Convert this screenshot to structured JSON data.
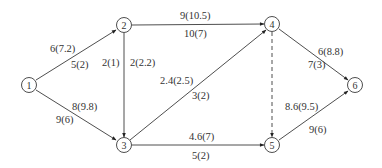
{
  "diagram": {
    "type": "directed-network",
    "nodes": [
      {
        "id": "1",
        "label": "1",
        "x": 29,
        "y": 85
      },
      {
        "id": "2",
        "label": "2",
        "x": 124,
        "y": 25
      },
      {
        "id": "3",
        "label": "3",
        "x": 124,
        "y": 145
      },
      {
        "id": "4",
        "label": "4",
        "x": 272,
        "y": 24
      },
      {
        "id": "5",
        "label": "5",
        "x": 272,
        "y": 145
      },
      {
        "id": "6",
        "label": "6",
        "x": 355,
        "y": 85
      }
    ],
    "edges": [
      {
        "from": "1",
        "to": "2",
        "label_top": "6(7.2)",
        "label_bottom": "5(2)",
        "style": "solid"
      },
      {
        "from": "1",
        "to": "3",
        "label_top": "8(9.8)",
        "label_bottom": "9(6)",
        "style": "solid"
      },
      {
        "from": "2",
        "to": "3",
        "label_left": "2(1)",
        "label_right": "2(2.2)",
        "style": "solid"
      },
      {
        "from": "2",
        "to": "4",
        "label_top": "9(10.5)",
        "label_bottom": "10(7)",
        "style": "solid"
      },
      {
        "from": "3",
        "to": "4",
        "label_top": "2.4(2.5)",
        "label_bottom": "3(2)",
        "style": "solid"
      },
      {
        "from": "3",
        "to": "5",
        "label_top": "4.6(7)",
        "label_bottom": "5(2)",
        "style": "solid"
      },
      {
        "from": "4",
        "to": "5",
        "style": "dashed"
      },
      {
        "from": "4",
        "to": "6",
        "label_top": "6(8.8)",
        "label_bottom": "7(3)",
        "style": "solid"
      },
      {
        "from": "5",
        "to": "6",
        "label_top": "8.6(9.5)",
        "label_bottom": "9(6)",
        "style": "solid"
      }
    ],
    "colors": {
      "stroke": "#3a3a3a",
      "text": "#333333",
      "background": "#ffffff"
    }
  }
}
